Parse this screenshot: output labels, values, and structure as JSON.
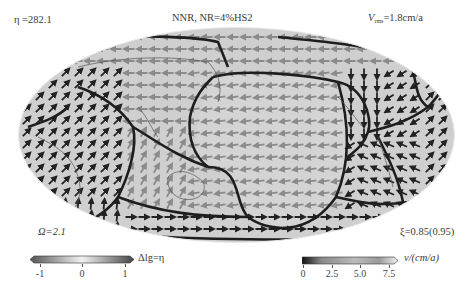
{
  "header": {
    "eta_label": "η =282.1",
    "title": "NNR, NR=4%HS2",
    "vrms_prefix": "V",
    "vrms_sub": "rms",
    "vrms_value": "=1.8cm/a"
  },
  "footer": {
    "omega_label": "Ω=2.1",
    "xi_label": "ξ=0.85(0.95)"
  },
  "colorbar_viscosity": {
    "title": "Δlg=η",
    "ticks": [
      "-1",
      "0",
      "1"
    ]
  },
  "colorbar_velocity": {
    "title": "v/(cm/a)",
    "ticks": [
      "0",
      "2.5",
      "5.0",
      "7.5"
    ]
  },
  "map": {
    "projection": "global elliptical (Robinson-like)",
    "background_color": "#cfcfcf",
    "boundary_color": "#1e1e1e",
    "arrow_dark": "#222222",
    "arrow_light": "#8a8a8a",
    "features": [
      "plate boundaries",
      "coastlines",
      "surface velocity vectors"
    ]
  }
}
